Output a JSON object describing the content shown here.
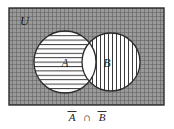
{
  "figure": {
    "type": "venn-diagram",
    "width": 174,
    "height": 129,
    "background_color": "#ffffff"
  },
  "universe": {
    "label": "U",
    "name": "universal-set",
    "rect": {
      "x": 9,
      "y": 8,
      "width": 155,
      "height": 97
    },
    "fill_pattern": "fine-grid-crosshatch",
    "fill_color": "#8f8f8f",
    "grid_line_color": "#5a5a5a",
    "grid_spacing_px": 4,
    "border_color": "#2b2b2b",
    "border_width": 1.4,
    "shaded": true,
    "label_position": {
      "x": 20,
      "y": 25
    }
  },
  "sets": [
    {
      "id": "A",
      "label": "A",
      "name": "set-a",
      "center": {
        "x": 65,
        "y": 62
      },
      "radius": 31,
      "fill": "#ffffff",
      "hatch": "horizontal",
      "hatch_color": "#3a3a3a",
      "hatch_spacing_px": 4.4,
      "stroke_color": "#2b2b2b",
      "label_position": {
        "x": 65,
        "y": 67
      }
    },
    {
      "id": "B",
      "label": "B",
      "name": "set-b",
      "center": {
        "x": 111,
        "y": 62
      },
      "radius": 29,
      "fill": "#ffffff",
      "hatch": "vertical",
      "hatch_color": "#3a3a3a",
      "hatch_spacing_px": 4.0,
      "stroke_color": "#2b2b2b",
      "label_position": {
        "x": 107,
        "y": 67
      }
    }
  ],
  "intersection": {
    "name": "intersection-lens",
    "fill": "#ffffff",
    "shaded": false,
    "description": "A intersect B left unshaded"
  },
  "caption": {
    "name": "figure-caption",
    "text": "A̅ ∩ B̅",
    "parts": {
      "left_operand": "A",
      "left_overbar": true,
      "operator": "∩",
      "right_operand": "B",
      "right_overbar": true
    },
    "position": {
      "x": 87,
      "y": 120
    },
    "color": "#1a1a1a"
  },
  "chart_data": {
    "type": "diagram",
    "title": "",
    "regions": [
      {
        "region": "U only (outside A and B)",
        "shading": "grid-crosshatch",
        "in_result": true
      },
      {
        "region": "A only",
        "shading": "horizontal-hatch",
        "in_result": false
      },
      {
        "region": "B only",
        "shading": "vertical-hatch",
        "in_result": false
      },
      {
        "region": "A intersect B",
        "shading": "none (white)",
        "in_result": false
      }
    ]
  }
}
